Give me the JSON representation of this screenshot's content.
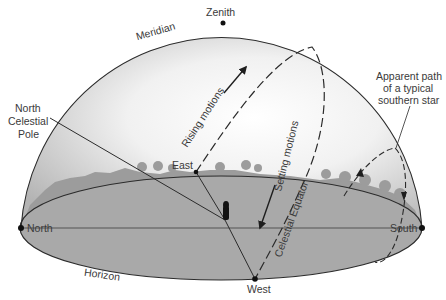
{
  "diagram": {
    "type": "celestial-sphere",
    "colors": {
      "dome_light": "#ffffff",
      "dome_dark": "#bdbdbd",
      "horizon_fill": "#a7a7a7",
      "trees": "#9a9a9a",
      "line": "#2b2b2b",
      "text": "#3a3a3a"
    },
    "labels": {
      "zenith": "Zenith",
      "meridian": "Meridian",
      "ncp_line1": "North",
      "ncp_line2": "Celestial",
      "ncp_line3": "Pole",
      "east": "East",
      "west": "West",
      "north": "North",
      "south": "South",
      "horizon": "Horizon",
      "rising": "Rising motions",
      "setting": "Setting motions",
      "equator": "Celestial Equator",
      "star_line1": "Apparent path",
      "star_line2": "of a typical",
      "star_line3": "southern star"
    },
    "points": [
      {
        "name": "Zenith",
        "x": 223,
        "y": 23
      },
      {
        "name": "North",
        "x": 21,
        "y": 228
      },
      {
        "name": "South",
        "x": 422,
        "y": 228
      },
      {
        "name": "East",
        "x": 196,
        "y": 172
      },
      {
        "name": "West",
        "x": 255,
        "y": 279
      },
      {
        "name": "Observer",
        "x": 225,
        "y": 218
      }
    ]
  }
}
